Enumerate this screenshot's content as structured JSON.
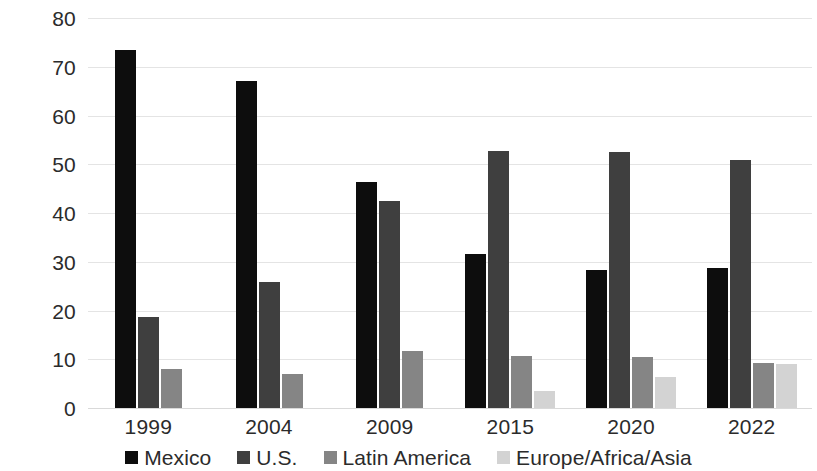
{
  "chart_data": {
    "type": "bar",
    "title": "",
    "subtitle": "",
    "xlabel": "",
    "ylabel": "",
    "categories": [
      "1999",
      "2004",
      "2009",
      "2015",
      "2020",
      "2022"
    ],
    "series": [
      {
        "name": "Mexico",
        "color": "#0d0d0d",
        "values": [
          73.5,
          67.0,
          46.3,
          31.6,
          28.4,
          28.7
        ]
      },
      {
        "name": "U.S.",
        "color": "#3f3f3f",
        "values": [
          18.7,
          25.8,
          42.5,
          52.7,
          52.5,
          50.8
        ]
      },
      {
        "name": "Latin America",
        "color": "#858585",
        "values": [
          8.0,
          6.9,
          11.6,
          10.6,
          10.4,
          9.2
        ]
      },
      {
        "name": "Europe/Africa/Asia",
        "color": "#d3d3d3",
        "values": [
          0,
          0,
          0,
          3.4,
          6.3,
          9.0
        ]
      }
    ],
    "ylim": [
      0,
      80
    ],
    "yticks": [
      0,
      10,
      20,
      30,
      40,
      50,
      60,
      70,
      80
    ],
    "ytick_labels": [
      "0",
      "10",
      "20",
      "30",
      "40",
      "50",
      "60",
      "70",
      "80"
    ],
    "grid": true,
    "grid_axis": "y",
    "legend_position": "bottom"
  },
  "legend": {
    "items": [
      {
        "label": "Mexico",
        "swatch": "legend-swatch-mexico"
      },
      {
        "label": "U.S.",
        "swatch": "legend-swatch-us"
      },
      {
        "label": "Latin America",
        "swatch": "legend-swatch-latin-america"
      },
      {
        "label": "Europe/Africa/Asia",
        "swatch": "legend-swatch-europe-africa-asia"
      }
    ]
  }
}
